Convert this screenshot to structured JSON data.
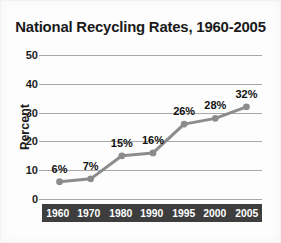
{
  "chart_data": {
    "type": "line",
    "title": "National Recycling Rates, 1960-2005",
    "xlabel": "",
    "ylabel": "Percent",
    "categories": [
      "1960",
      "1970",
      "1980",
      "1990",
      "1995",
      "2000",
      "2005"
    ],
    "values": [
      6,
      7,
      15,
      16,
      26,
      28,
      32
    ],
    "point_labels": [
      "6%",
      "7%",
      "15%",
      "16%",
      "26%",
      "28%",
      "32%"
    ],
    "ylim": [
      0,
      50
    ],
    "yticks": [
      50,
      40,
      30,
      20,
      10,
      0
    ],
    "ytick_labels": [
      "50",
      "40",
      "30",
      "20",
      "10",
      "0"
    ],
    "grid": true,
    "legend": false,
    "series_color": "#8c8c8c",
    "marker_color": "#8c8c8c",
    "gridline_color": "#a8a8a8",
    "axis_bar_color": "#3e3e3e",
    "axis_bar_text_color": "#ffffff",
    "title_color": "#1a1a1a",
    "background_color": "#fdfdfd"
  }
}
